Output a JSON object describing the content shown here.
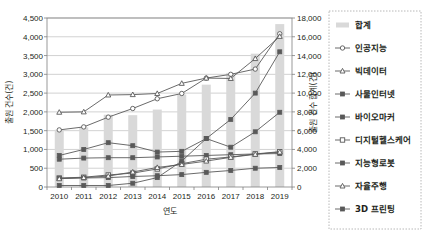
{
  "chart_data": {
    "type": "line",
    "title": "",
    "xlabel": "연도",
    "ylabel": "출원 건수(건)",
    "ylabel_secondary": "출원 건수 합계(건)",
    "categories": [
      "2010",
      "2011",
      "2012",
      "2013",
      "2014",
      "2015",
      "2016",
      "2017",
      "2018",
      "2019"
    ],
    "x_tick_labels": [
      "2010",
      "2011",
      "2012",
      "2013",
      "2014",
      "2015",
      "2016",
      "2017",
      "2018",
      "2019"
    ],
    "y_tick_labels": [
      "0",
      "500",
      "1,000",
      "1,500",
      "2,000",
      "2,500",
      "3,000",
      "3,500",
      "4,000",
      "4,500"
    ],
    "y2_tick_labels": [
      "0",
      "2,000",
      "4,000",
      "6,000",
      "8,000",
      "10,000",
      "12,000",
      "14,000",
      "16,000",
      "18,000"
    ],
    "ylim": [
      0,
      4500
    ],
    "y2lim": [
      0,
      18000
    ],
    "grid": true,
    "legend_position": "right",
    "series": [
      {
        "name": "합계",
        "marker": "bar",
        "axis": "secondary",
        "values": [
          6100,
          6350,
          7700,
          7650,
          8250,
          9850,
          10900,
          12150,
          14200,
          17350
        ]
      },
      {
        "name": "인공지능",
        "marker": "open-circle",
        "axis": "primary",
        "values": [
          1520,
          1600,
          1860,
          2090,
          2350,
          2490,
          2900,
          3000,
          3140,
          4080
        ]
      },
      {
        "name": "빅데이터",
        "marker": "open-triangle",
        "axis": "primary",
        "values": [
          1990,
          2000,
          2450,
          2460,
          2490,
          2760,
          2900,
          2890,
          3420,
          4010
        ]
      },
      {
        "name": "사물인터넷",
        "marker": "filled-square",
        "axis": "primary",
        "values": [
          840,
          1000,
          1180,
          1100,
          930,
          950,
          1290,
          1060,
          1470,
          1990
        ]
      },
      {
        "name": "바이오마커",
        "marker": "filled-square",
        "axis": "primary",
        "values": [
          740,
          770,
          780,
          780,
          800,
          820,
          840,
          860,
          880,
          890
        ]
      },
      {
        "name": "디지털헬스케어",
        "marker": "open-square",
        "axis": "primary",
        "values": [
          240,
          260,
          320,
          370,
          480,
          620,
          740,
          800,
          880,
          940
        ]
      },
      {
        "name": "지능형로봇",
        "marker": "filled-square",
        "axis": "primary",
        "values": [
          230,
          240,
          250,
          280,
          300,
          330,
          390,
          440,
          500,
          520
        ]
      },
      {
        "name": "자율주행",
        "marker": "open-triangle",
        "axis": "primary",
        "values": [
          220,
          250,
          290,
          400,
          520,
          600,
          690,
          790,
          870,
          930
        ]
      },
      {
        "name": "3D 프린팅",
        "marker": "filled-square",
        "axis": "primary",
        "values": [
          40,
          40,
          40,
          100,
          250,
          690,
          1290,
          1800,
          2500,
          3600
        ]
      }
    ]
  },
  "legend": {
    "items": [
      {
        "label": "합계",
        "marker": "bar"
      },
      {
        "label": "인공지능",
        "marker": "open-circle"
      },
      {
        "label": "빅데이터",
        "marker": "open-triangle"
      },
      {
        "label": "사물인터넷",
        "marker": "filled-square"
      },
      {
        "label": "바이오마커",
        "marker": "filled-square"
      },
      {
        "label": "디지털헬스케어",
        "marker": "open-square"
      },
      {
        "label": "지능형로봇",
        "marker": "filled-square"
      },
      {
        "label": "자율주행",
        "marker": "open-triangle"
      },
      {
        "label": "3D 프린팅",
        "marker": "filled-square"
      }
    ]
  },
  "colors": {
    "bar": "#d9d9d9",
    "line": "#595959",
    "grid": "#bfbfbf",
    "axis": "#808080",
    "text": "#231f20"
  }
}
